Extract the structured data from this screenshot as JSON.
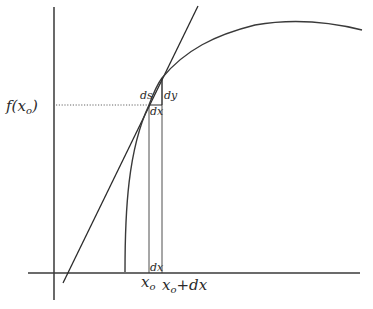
{
  "diagram": {
    "labels": {
      "y_value": "f(x",
      "y_value_sub": "o",
      "y_value_close": ")",
      "ds": "ds",
      "dy": "dy",
      "dx_top": "dx",
      "dx_bottom": "dx",
      "x0": "x",
      "x0_sub": "o",
      "x0_plus": "x",
      "x0_plus_sub": "o",
      "x0_plus_rest": "+dx"
    },
    "colors": {
      "line": "#2a2a2a",
      "curve": "#3a3a3a",
      "dotted": "#555555",
      "background": "#ffffff"
    }
  }
}
